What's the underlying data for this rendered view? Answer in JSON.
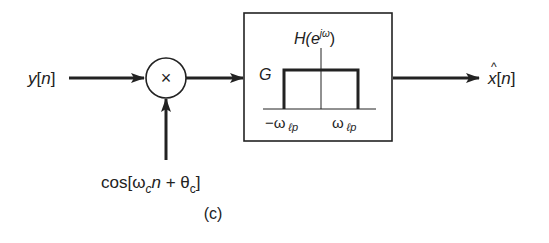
{
  "diagram": {
    "type": "block-diagram",
    "caption": "(c)",
    "input": {
      "label_base": "y",
      "label_index": "[n]"
    },
    "multiplier": {
      "symbol": "×"
    },
    "carrier": {
      "label_prefix": "cos[",
      "omega": "ω",
      "omega_sub": "c",
      "n": "n",
      "plus": " + ",
      "theta": "θ",
      "theta_sub": "c",
      "close": "]"
    },
    "filter": {
      "title_prefix": "H(e",
      "title_sup": "jω",
      "title_suffix": ")",
      "gain_label": "G",
      "left_cutoff": "−ω",
      "right_cutoff": "ω",
      "cutoff_sub": "ℓp"
    },
    "output": {
      "label_base": "x",
      "hat": "^",
      "label_index": "[n]"
    },
    "colors": {
      "stroke": "#222222",
      "background": "#ffffff"
    }
  }
}
